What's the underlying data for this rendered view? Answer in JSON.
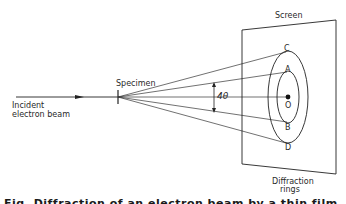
{
  "diagram": {
    "labels": {
      "specimen": "Specimen",
      "incident_line1": "Incident",
      "incident_line2": "electron beam",
      "screen": "Screen",
      "angle": "4θ",
      "point_c": "C",
      "point_a": "A",
      "point_o": "O",
      "point_b": "B",
      "point_d": "D",
      "rings_line1": "Diffraction",
      "rings_line2": "rings"
    },
    "caption": "Fig. Diffraction of an electron beam by a thin film"
  }
}
